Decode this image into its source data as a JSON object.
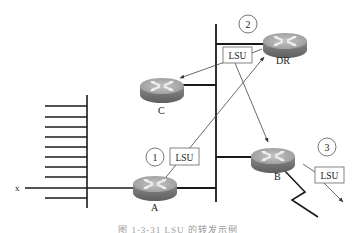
{
  "diagram": {
    "type": "network-topology",
    "routers": [
      {
        "id": "A",
        "label": "A"
      },
      {
        "id": "B",
        "label": "B"
      },
      {
        "id": "C",
        "label": "C"
      },
      {
        "id": "DR",
        "label": "DR"
      }
    ],
    "networks": [
      {
        "id": "multi-access-bus",
        "desc": "vertical shared segment connecting A, B, C, DR"
      },
      {
        "id": "stub-comb",
        "desc": "left network bus with many hosts"
      },
      {
        "id": "serial-link",
        "desc": "zigzag WAN link from B"
      }
    ],
    "steps": [
      {
        "number": "1",
        "packet": "LSU",
        "desc": "A sends LSU to DR"
      },
      {
        "number": "2",
        "packet": "LSU",
        "desc": "DR floods LSU to C and B"
      },
      {
        "number": "3",
        "packet": "LSU",
        "desc": "B forwards LSU out of other interface"
      }
    ],
    "network_label": "x",
    "lsu_label": "LSU",
    "caption": "图 1-3-31  LSU 的转发示例"
  },
  "colors": {
    "line": "#1a1a1a",
    "thin_line": "#555555",
    "router_top": "#a9a9a9",
    "router_side": "#777777",
    "router_x": "#e8e8e8",
    "box_border": "#666666"
  }
}
